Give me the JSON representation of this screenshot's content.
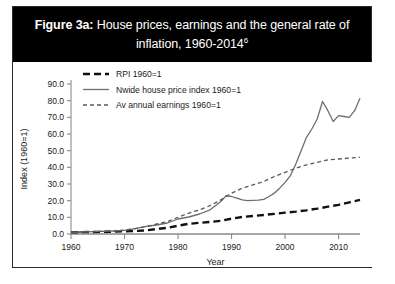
{
  "figure": {
    "label": "Figure 3a:",
    "title_rest": " House prices, earnings and the general rate of inflation, 1960-2014",
    "footnote_marker": "6",
    "banner_color": "#000000",
    "banner_text_color": "#ffffff"
  },
  "chart_data": {
    "type": "line",
    "title": "House prices, earnings and the general rate of inflation, 1960-2014",
    "xlabel": "Year",
    "ylabel": "Index (1960=1)",
    "xlim": [
      1960,
      2014
    ],
    "ylim": [
      0,
      90
    ],
    "xticks": [
      1960,
      1970,
      1980,
      1990,
      2000,
      2010
    ],
    "xtick_labels": [
      "1960",
      "1970",
      "1980",
      "1990",
      "2000",
      "2010"
    ],
    "yticks": [
      0,
      10,
      20,
      30,
      40,
      50,
      60,
      70,
      80,
      90
    ],
    "ytick_labels": [
      "0.0",
      "10.0",
      "20.0",
      "30.0",
      "40.0",
      "50.0",
      "60.0",
      "70.0",
      "80.0",
      "90.0"
    ],
    "grid": false,
    "legend_position": "upper left",
    "series": [
      {
        "name": "RPI 1960=1",
        "style": "dashed-thick",
        "color": "#111111",
        "x": [
          1960,
          1962,
          1964,
          1966,
          1968,
          1970,
          1972,
          1974,
          1976,
          1978,
          1980,
          1982,
          1984,
          1986,
          1988,
          1990,
          1992,
          1994,
          1996,
          1998,
          2000,
          2002,
          2004,
          2006,
          2008,
          2010,
          2012,
          2014
        ],
        "values": [
          1.0,
          1.1,
          1.2,
          1.3,
          1.4,
          1.6,
          1.8,
          2.2,
          3.0,
          3.7,
          5.0,
          6.1,
          6.7,
          7.2,
          7.9,
          9.2,
          10.2,
          10.8,
          11.4,
          12.1,
          12.8,
          13.4,
          14.2,
          15.2,
          16.4,
          17.5,
          19.0,
          20.5
        ]
      },
      {
        "name": "Nwide house price index 1960=1",
        "style": "solid",
        "color": "#6e6e6e",
        "x": [
          1960,
          1962,
          1964,
          1966,
          1968,
          1970,
          1972,
          1974,
          1976,
          1978,
          1980,
          1982,
          1984,
          1986,
          1988,
          1989,
          1990,
          1991,
          1992,
          1993,
          1994,
          1995,
          1996,
          1997,
          1998,
          1999,
          2000,
          2001,
          2002,
          2003,
          2004,
          2005,
          2006,
          2007,
          2008,
          2009,
          2010,
          2011,
          2012,
          2013,
          2014
        ],
        "values": [
          1.0,
          1.2,
          1.4,
          1.6,
          1.8,
          2.2,
          3.2,
          4.6,
          5.4,
          6.6,
          9.0,
          10.2,
          12.0,
          14.5,
          19.5,
          23.0,
          22.5,
          21.5,
          20.5,
          20.0,
          20.2,
          20.3,
          20.8,
          22.5,
          24.5,
          27.5,
          31.0,
          35.0,
          42.0,
          50.0,
          58.0,
          63.0,
          69.0,
          79.5,
          74.0,
          67.5,
          71.0,
          70.5,
          70.0,
          74.0,
          81.5
        ]
      },
      {
        "name": "Av annual earnings 1960=1",
        "style": "dashed-thin",
        "color": "#5a5a5a",
        "x": [
          1960,
          1962,
          1964,
          1966,
          1968,
          1970,
          1972,
          1974,
          1976,
          1978,
          1980,
          1982,
          1984,
          1986,
          1988,
          1990,
          1992,
          1994,
          1996,
          1998,
          2000,
          2002,
          2004,
          2006,
          2008,
          2010,
          2012,
          2014
        ],
        "values": [
          1.0,
          1.2,
          1.4,
          1.6,
          1.9,
          2.4,
          3.2,
          4.4,
          6.0,
          7.4,
          10.0,
          12.5,
          14.5,
          17.0,
          20.5,
          24.5,
          27.5,
          29.5,
          31.5,
          34.5,
          37.0,
          39.5,
          41.5,
          43.0,
          44.5,
          45.0,
          45.5,
          46.0
        ]
      }
    ]
  }
}
